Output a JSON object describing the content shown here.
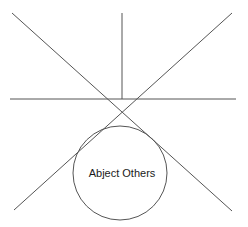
{
  "canvas": {
    "width": 248,
    "height": 227,
    "background": "#ffffff"
  },
  "style": {
    "line_color": "#555555",
    "circle_color": "#555555",
    "text_color": "#1a1a1a",
    "line_width": 1
  },
  "diagram": {
    "type": "line-and-circle-geometric-diagram",
    "intersection_point": {
      "x": 122,
      "y": 99
    },
    "lines": [
      {
        "name": "vertical-axis-line",
        "x1": 122,
        "y1": 13,
        "x2": 122,
        "y2": 99
      },
      {
        "name": "horizontal-axis-line",
        "x1": 10,
        "y1": 99,
        "x2": 236,
        "y2": 99
      },
      {
        "name": "diagonal-nw-se-line",
        "x1": 12,
        "y1": 13,
        "x2": 232,
        "y2": 211
      },
      {
        "name": "diagonal-ne-sw-line",
        "x1": 232,
        "y1": 13,
        "x2": 14,
        "y2": 210
      }
    ],
    "circle": {
      "name": "abject-others-circle",
      "cx": 120,
      "cy": 173,
      "r": 47
    },
    "label": {
      "text": "Abject Others",
      "x": 122,
      "y": 174
    }
  }
}
